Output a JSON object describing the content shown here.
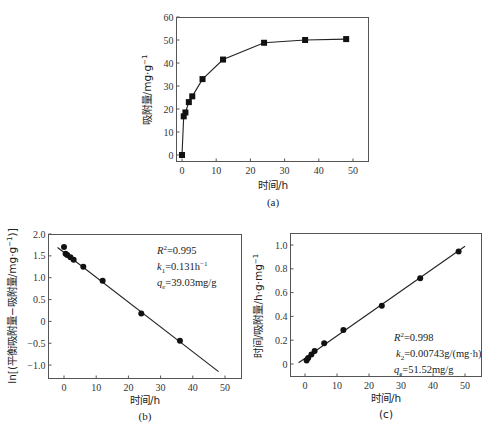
{
  "chart_data": [
    {
      "id": "a",
      "type": "line",
      "caption": "(a)",
      "title": "",
      "xlabel": "时间/h",
      "ylabel": "吸附量/mg·g⁻¹",
      "xlim": [
        -1.5,
        55
      ],
      "ylim": [
        -3,
        61
      ],
      "xticks": [
        0,
        10,
        20,
        30,
        40,
        50
      ],
      "yticks": [
        0,
        10,
        20,
        30,
        40,
        50,
        60
      ],
      "grid": false,
      "marker": "square",
      "series": [
        {
          "name": "吸附量",
          "x": [
            0,
            0.5,
            1,
            2,
            3,
            6,
            12,
            24,
            36,
            48
          ],
          "y": [
            0,
            16.8,
            18.5,
            23,
            25.5,
            33,
            41.5,
            48.8,
            50,
            50.4
          ]
        }
      ]
    },
    {
      "id": "b",
      "type": "scatter",
      "caption": "(b)",
      "title": "",
      "xlabel": "时间/h",
      "ylabel": "ln[(平衡吸附量−吸附量/mg·g⁻¹)]",
      "xlim": [
        -5,
        55
      ],
      "ylim": [
        -1.3,
        2.05
      ],
      "xticks": [
        0,
        10,
        20,
        30,
        40,
        50
      ],
      "yticks": [
        -1.0,
        -0.5,
        0,
        0.5,
        1.0,
        1.5,
        2.0
      ],
      "grid": false,
      "marker": "circle",
      "series": [
        {
          "name": "data",
          "x": [
            0,
            0.5,
            1,
            2,
            3,
            6,
            12,
            24,
            36
          ],
          "y": [
            1.7,
            1.55,
            1.52,
            1.47,
            1.41,
            1.25,
            0.93,
            0.18,
            -0.44
          ]
        }
      ],
      "fit_line": {
        "x": [
          -2,
          48
        ],
        "y": [
          1.69,
          -1.15
        ]
      },
      "annotations": [
        "R²=0.995",
        "k₁=0.131h⁻¹",
        "qₑ=39.03mg/g"
      ]
    },
    {
      "id": "c",
      "type": "scatter",
      "caption": "(c)",
      "title": "",
      "xlabel": "时间/h",
      "ylabel": "时间/吸附量/h·g·mg⁻¹",
      "xlim": [
        -5,
        55
      ],
      "ylim": [
        -0.1,
        1.08
      ],
      "xticks": [
        0,
        10,
        20,
        30,
        40,
        50
      ],
      "yticks": [
        0,
        0.2,
        0.4,
        0.6,
        0.8,
        1.0
      ],
      "grid": false,
      "marker": "circle",
      "series": [
        {
          "name": "data",
          "x": [
            0.5,
            1,
            2,
            3,
            6,
            12,
            24,
            36,
            48
          ],
          "y": [
            0.03,
            0.05,
            0.08,
            0.11,
            0.175,
            0.285,
            0.49,
            0.72,
            0.945
          ]
        }
      ],
      "fit_line": {
        "x": [
          -2,
          50
        ],
        "y": [
          0.01,
          0.99
        ]
      },
      "annotations": [
        "R²=0.998",
        "k₂=0.00743g/(mg·h)",
        "qₑ=51.52mg/g"
      ]
    }
  ],
  "labels": {
    "a": {
      "caption": "(a)",
      "xlabel": "时间/h",
      "ylabel": "吸附量/mg·g",
      "ylabel_sup": "−1"
    },
    "b": {
      "caption": "(b)",
      "xlabel": "时间/h",
      "ylabel": "ln[(平衡吸附量−吸附量/mg·g",
      "ylabel_sup": "−1",
      "ylabel_end": ")]",
      "ann": [
        {
          "main": "R",
          "sup": "2",
          "rest": "=0.995"
        },
        {
          "main": "k",
          "sub": "1",
          "rest": "=0.131h",
          "sup2": "−1"
        },
        {
          "main": "q",
          "sub": "e",
          "rest": "=39.03mg/g"
        }
      ]
    },
    "c": {
      "caption": "(c)",
      "xlabel": "时间/h",
      "ylabel": "时间/吸附量/h·g·mg",
      "ylabel_sup": "−1",
      "ann": [
        {
          "main": "R",
          "sup": "2",
          "rest": "=0.998"
        },
        {
          "main": "k",
          "sub": "2",
          "rest": "=0.00743g/(mg·h)"
        },
        {
          "main": "q",
          "sub": "e",
          "rest": "=51.52mg/g"
        }
      ]
    }
  }
}
